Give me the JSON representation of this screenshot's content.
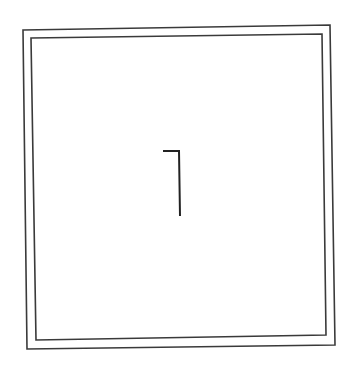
{
  "diagram": {
    "colors": {
      "background": "#ffffff",
      "outer_border": "#3a3a3a",
      "inner_border": "#3a3a3a",
      "glyph": "#222222"
    },
    "outer_frame": {
      "points": "23,30 330,25 335,345 27,349",
      "stroke_width": "1.6"
    },
    "inner_frame": {
      "points": "31,38 322,34 326,335 36,340",
      "stroke_width": "1.6"
    },
    "center_glyph": {
      "name": "corner-bracket",
      "points": "163,151 179,151 180,216",
      "stroke_width": "2"
    }
  }
}
